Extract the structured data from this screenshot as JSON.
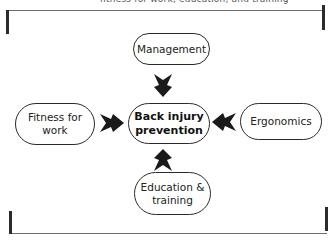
{
  "header": {
    "caption_fragment": "fitness for work, education, and training"
  },
  "diagram": {
    "title_node": {
      "lines": [
        "Back injury",
        "prevention"
      ]
    },
    "nodes": {
      "top": {
        "lines": [
          "Management"
        ]
      },
      "left": {
        "lines": [
          "Fitness for",
          "work"
        ]
      },
      "right": {
        "lines": [
          "Ergonomics"
        ]
      },
      "bottom": {
        "lines": [
          "Education &",
          "training"
        ]
      }
    },
    "arrows": [
      {
        "from": "Management",
        "to": "Back injury prevention",
        "direction": "down"
      },
      {
        "from": "Fitness for work",
        "to": "Back injury prevention",
        "direction": "right"
      },
      {
        "from": "Ergonomics",
        "to": "Back injury prevention",
        "direction": "left"
      },
      {
        "from": "Education & training",
        "to": "Back injury prevention",
        "direction": "up"
      }
    ],
    "colors": {
      "stroke": "#2a2a2a",
      "arrow_fill": "#1a1a1a",
      "bracket": "#2b2b2b"
    }
  }
}
